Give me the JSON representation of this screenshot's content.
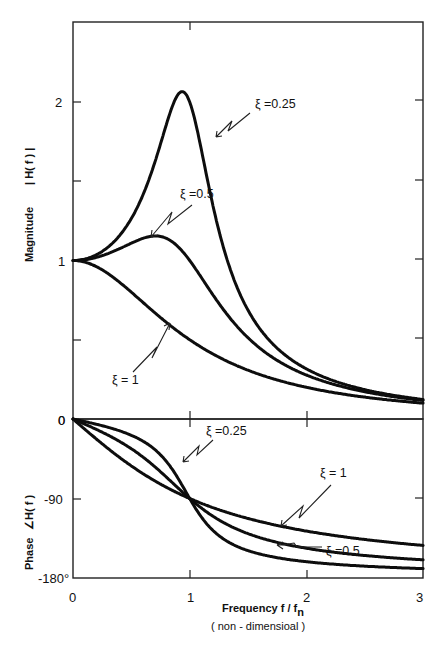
{
  "chart_data": [
    {
      "panel": "magnitude",
      "type": "line",
      "title": "",
      "xlabel": "Frequency f / fn (non - dimensioal)",
      "ylabel": "Magnitude |H(f)|",
      "xlim": [
        0,
        3
      ],
      "ylim": [
        0,
        2.5
      ],
      "x_ticks": [
        0,
        1,
        2,
        3
      ],
      "y_tick_labels": [
        {
          "value": 0,
          "label": "0"
        },
        {
          "value": 1,
          "label": "1"
        },
        {
          "value": 2,
          "label": "2"
        }
      ],
      "y_minor_ticks": [
        0.5,
        1.5
      ],
      "grid": false,
      "x": [
        0,
        0.25,
        0.5,
        0.75,
        1.0,
        1.25,
        1.5,
        1.75,
        2.0,
        2.5,
        3.0
      ],
      "series": [
        {
          "name": "ζ = 0.25",
          "values": [
            1.0,
            1.06,
            1.26,
            1.7,
            2.0,
            1.31,
            0.69,
            0.44,
            0.31,
            0.18,
            0.12
          ]
        },
        {
          "name": "ζ = 0.5",
          "values": [
            1.0,
            1.03,
            1.11,
            1.09,
            1.0,
            0.77,
            0.6,
            0.4,
            0.28,
            0.17,
            0.12
          ]
        },
        {
          "name": "ζ = 1",
          "values": [
            1.0,
            0.94,
            0.8,
            0.64,
            0.5,
            0.39,
            0.31,
            0.25,
            0.2,
            0.14,
            0.1
          ]
        }
      ],
      "annotations": [
        {
          "text": "ξ = 0.25",
          "points_to": "ζ = 0.25 curve near f/fn ≈ 1.2"
        },
        {
          "text": "ξ = 0.5",
          "points_to": "ζ = 0.5 peak near f/fn ≈ 0.7"
        },
        {
          "text": "ξ = 1",
          "points_to": "ζ = 1 curve near f/fn ≈ 0.85"
        }
      ]
    },
    {
      "panel": "phase",
      "type": "line",
      "title": "",
      "xlabel": "Frequency f / fn (non - dimensioal)",
      "ylabel": "Phase ∠H(f)",
      "xlim": [
        0,
        3
      ],
      "ylim": [
        -180,
        0
      ],
      "x_ticks": [
        0,
        1,
        2,
        3
      ],
      "y_tick_labels": [
        {
          "value": 0,
          "label": "0"
        },
        {
          "value": -90,
          "label": "-90"
        },
        {
          "value": -180,
          "label": "-180°"
        }
      ],
      "grid": false,
      "x": [
        0,
        0.25,
        0.5,
        0.75,
        1.0,
        1.25,
        1.5,
        1.75,
        2.0,
        2.5,
        3.0
      ],
      "series": [
        {
          "name": "ζ = 0.25",
          "values": [
            0,
            -7.6,
            -18.4,
            -40.6,
            -90,
            -131.6,
            -149.0,
            -156.2,
            -161.6,
            -167.2,
            -169.3
          ]
        },
        {
          "name": "ζ = 0.5",
          "values": [
            0,
            -15.0,
            -33.7,
            -59.7,
            -90,
            -114.0,
            -129.8,
            -139.4,
            -146.3,
            -154.5,
            -159.4
          ]
        },
        {
          "name": "ζ = 1",
          "values": [
            0,
            -28.1,
            -53.1,
            -73.7,
            -90,
            -102.7,
            -112.6,
            -120.5,
            -126.9,
            -136.4,
            -143.1
          ]
        }
      ],
      "annotations": [
        {
          "text": "ξ = 0.25",
          "points_to": "ζ = 0.25 curve near f/fn ≈ 0.95"
        },
        {
          "text": "ξ = 1",
          "points_to": "ζ = 1 curve near f/fn ≈ 1.8"
        },
        {
          "text": "ξ = 0.5",
          "points_to": "ζ = 0.5 curve near f/fn ≈ 1.7"
        }
      ]
    }
  ],
  "labels": {
    "mag_ylabel_magnitude": "Magnitude",
    "mag_ylabel_hf": "| H( f ) |",
    "phase_ylabel_phase": "Phase",
    "phase_ylabel_hf": "∠H( f )",
    "xlabel_line1": "Frequency  f / f",
    "xlabel_sub": "n",
    "xlabel_line2": "( non - dimensioal )",
    "mag_tick_0": "0",
    "mag_tick_1": "1",
    "mag_tick_2": "2",
    "phase_tick_0": "0",
    "phase_tick_m90": "-90",
    "phase_tick_m180": "-180°",
    "x_tick_0": "0",
    "x_tick_1": "1",
    "x_tick_2": "2",
    "x_tick_3": "3",
    "annot_mag_025": "ξ =0.25",
    "annot_mag_05": "ξ =0.5",
    "annot_mag_1": "ξ = 1",
    "annot_ph_025": "ξ =0.25",
    "annot_ph_1": "ξ = 1",
    "annot_ph_05": "ξ =0.5"
  },
  "layout": {
    "x0_px": 73,
    "x_px_per_unit": 116.7,
    "mag_zero_px": 419,
    "mag_px_per_unit": 158.5,
    "phase_zero_px": 419,
    "phase_px_per_deg": 0.8833,
    "damping_ratios": [
      0.25,
      0.5,
      1.0
    ],
    "ink_color": "#0d0d0d"
  }
}
